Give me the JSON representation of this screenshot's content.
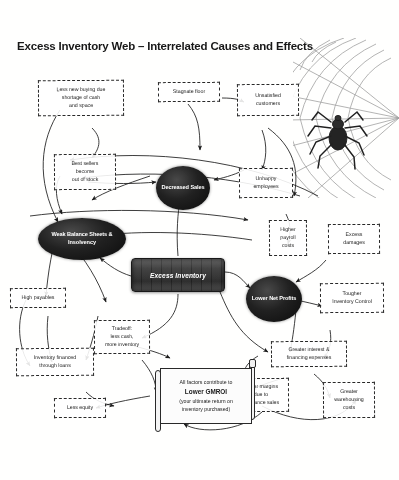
{
  "title": "Excess Inventory Web – Interrelated Causes and Effects",
  "colors": {
    "node_fill": "#ffffff",
    "node_border": "#2a2a2a",
    "ellipse_fill": "#1a1a1a",
    "ellipse_text": "#ffffff",
    "center_box_fill": "#3a3a3a",
    "background": "#fdfdfc",
    "text": "#1c1c1c"
  },
  "center": {
    "label": "Excess Inventory"
  },
  "ellipse_nodes": [
    {
      "id": "decreased-sales",
      "label": "Decreased\nSales",
      "lines": [
        "Decreased",
        "Sales"
      ]
    },
    {
      "id": "weak-balance-sheets",
      "label": "Weak Balance Sheets & Insolvency",
      "lines": [
        "Weak Balance Sheets",
        "& Insolvency"
      ]
    },
    {
      "id": "lower-net-profits",
      "label": "Lower Net Profits",
      "lines": [
        "Lower",
        "Net Profits"
      ]
    }
  ],
  "dashed_nodes": [
    {
      "id": "less-new-buying",
      "lines": [
        "Less new buying due",
        "shortage of cash",
        "and space"
      ]
    },
    {
      "id": "stagnate-floor",
      "lines": [
        "Stagnate floor"
      ]
    },
    {
      "id": "unsatisfied-customers",
      "lines": [
        "Unsatisfied",
        "customers"
      ]
    },
    {
      "id": "best-sellers-out-of-stock",
      "lines": [
        "Best sellers",
        "become",
        "out of stock"
      ]
    },
    {
      "id": "unhappy-employees",
      "lines": [
        "Unhappy",
        "employees"
      ]
    },
    {
      "id": "higher-payroll-costs",
      "lines": [
        "Higher",
        "payroll",
        "costs"
      ]
    },
    {
      "id": "excess-damages",
      "lines": [
        "Excess",
        "damages"
      ]
    },
    {
      "id": "tougher-inventory-control",
      "lines": [
        "Tougher",
        "Inventory Control"
      ]
    },
    {
      "id": "high-payables",
      "lines": [
        "High payables"
      ]
    },
    {
      "id": "tradeoff-less-cash",
      "lines": [
        "Tradeoff:",
        "less cash,",
        "more inventory"
      ]
    },
    {
      "id": "inventory-financed-loans",
      "lines": [
        "Inventory financed",
        "through loans"
      ]
    },
    {
      "id": "less-equity",
      "lines": [
        "Less equity"
      ]
    },
    {
      "id": "greater-interest-financing",
      "lines": [
        "Greater interest &",
        "financing expenses"
      ]
    },
    {
      "id": "lower-margins-clearance",
      "lines": [
        "Lower margins",
        "due to",
        "clearance sales"
      ]
    },
    {
      "id": "greater-warehousing-costs",
      "lines": [
        "Greater",
        "warehousing",
        "costs"
      ]
    }
  ],
  "scroll": {
    "line1": "All factors contribute to",
    "gmroi": "Lower GMROI",
    "line3": "(your ultimate return on",
    "line4": "inventory purchased)"
  },
  "decoration": {
    "spider_web": "spider-web-graphic",
    "spider": "spider-graphic"
  }
}
